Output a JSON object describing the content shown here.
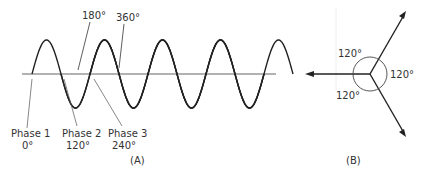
{
  "diagram_a": {
    "caption": "(A)",
    "top_labels": [
      "180°",
      "360°"
    ],
    "phases": [
      {
        "name": "Phase 1",
        "angle": "0°"
      },
      {
        "name": "Phase 2",
        "angle": "120°"
      },
      {
        "name": "Phase 3",
        "angle": "240°"
      }
    ]
  },
  "diagram_b": {
    "caption": "(B)",
    "angles": [
      "120°",
      "120°",
      "120°"
    ]
  },
  "colors": {
    "line": "#222222",
    "axis": "#999999",
    "text": "#333333"
  }
}
